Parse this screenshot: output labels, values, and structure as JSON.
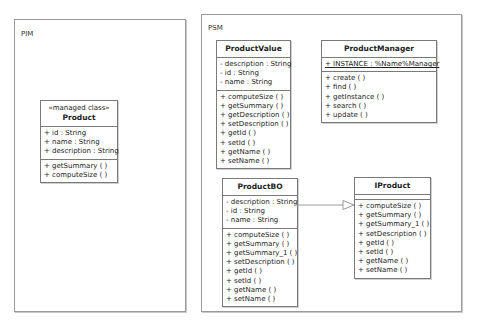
{
  "packages": {
    "pim": {
      "label": "PIM"
    },
    "psm": {
      "label": "PSM"
    }
  },
  "classes": {
    "product": {
      "stereotype": "«managed class»",
      "name": "Product",
      "attributes": [
        "+ id : String",
        "+ name : String",
        "+ description : String"
      ],
      "operations": [
        "+ getSummary (  )",
        "+ computeSize (  )"
      ]
    },
    "product_value": {
      "name": "ProductValue",
      "attributes": [
        "- description : String",
        "- id : String",
        "- name : String"
      ],
      "operations": [
        "+ computeSize (  )",
        "+ getSummary (  )",
        "+ getDescription (  )",
        "+ setDescription (  )",
        "+ getId (  )",
        "+ setId (  )",
        "+ getName (  )",
        "+ setName (  )"
      ]
    },
    "product_manager": {
      "name": "ProductManager",
      "attributes": [
        "+ INSTANCE : %Name%Manager"
      ],
      "operations": [
        "+ create (  )",
        "+ find (  )",
        "+ getInstance (  )",
        "+ search (  )",
        "+ update (  )"
      ]
    },
    "product_bo": {
      "name": "ProductBO",
      "attributes": [
        "- description : String",
        "- id : String",
        "- name : String"
      ],
      "operations": [
        "+ computeSize (  )",
        "+ getSummary (  )",
        "+ getSummary_1 (  )",
        "+ setDescription (  )",
        "+ getId (  )",
        "+ setId (  )",
        "+ getName (  )",
        "+ setName (  )"
      ]
    },
    "iproduct": {
      "name": "IProduct",
      "attributes": [],
      "operations": [
        "+ computeSize (  )",
        "+ getSummary (  )",
        "+ getSummary_1 (  )",
        "+ setDescription (  )",
        "+ getId (  )",
        "+ setId (  )",
        "+ getName (  )",
        "+ setName (  )"
      ]
    }
  },
  "relations": [
    {
      "type": "realization",
      "from": "ProductBO",
      "to": "IProduct"
    }
  ],
  "colors": {
    "border": "#7a7a7a",
    "package_border": "#9a9a9a",
    "connector": "#9a9a9a"
  }
}
